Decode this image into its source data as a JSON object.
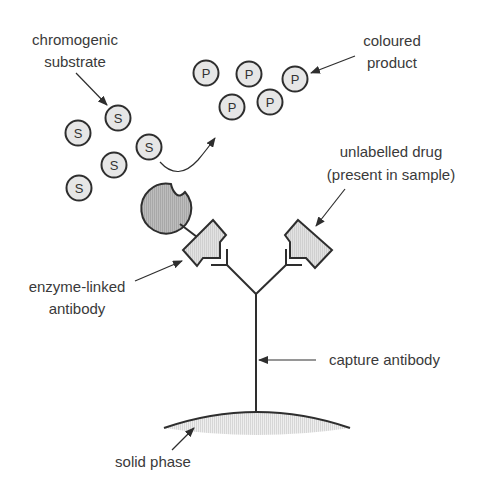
{
  "diagram": {
    "type": "ELISA competitive immunoassay schematic",
    "labels": {
      "chromogenic_substrate": [
        "chromogenic",
        "substrate"
      ],
      "coloured_product": [
        "coloured",
        "product"
      ],
      "unlabelled_drug": [
        "unlabelled drug",
        "(present in sample)"
      ],
      "enzyme_linked_antibody": [
        "enzyme-linked",
        "antibody"
      ],
      "capture_antibody": "capture antibody",
      "solid_phase": "solid phase"
    },
    "substrate_symbol": "S",
    "product_symbol": "P",
    "substrate_count": 5,
    "product_count": 5,
    "colors": {
      "line": "#2e2e2e",
      "molecule_fill": "#e6e6e6",
      "enzyme_fill": "#b3b3b3",
      "antigen_fill": "#dcdcdc",
      "solid_phase_fill": "#e4e4e4",
      "text": "#3a3a3a"
    }
  }
}
